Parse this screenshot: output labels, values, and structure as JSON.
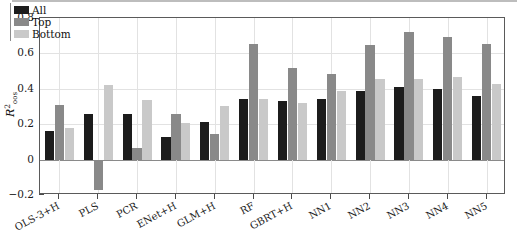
{
  "chart_data": {
    "type": "bar",
    "title": "",
    "subtitle": "",
    "xlabel": "",
    "ylabel": "R2oos",
    "ylabel_parts": {
      "base": "R",
      "superscript": "2",
      "subscript": "oos"
    },
    "ylim": [
      -0.2,
      0.8
    ],
    "yticks": [
      -0.2,
      0,
      0.2,
      0.4,
      0.6,
      0.8
    ],
    "ytick_labels": [
      "−0.2",
      "0",
      "0.2",
      "0.4",
      "0.6",
      "0.8"
    ],
    "grid": true,
    "grid_axis": "both",
    "legend_position": "top-left",
    "categories": [
      "OLS-3+H",
      "PLS",
      "PCR",
      "ENet+H",
      "GLM+H",
      "RF",
      "GBRT+H",
      "NN1",
      "NN2",
      "NN3",
      "NN4",
      "NN5"
    ],
    "series": [
      {
        "name": "All",
        "color": "#1c1c1c",
        "values": [
          0.16,
          0.26,
          0.26,
          0.125,
          0.21,
          0.345,
          0.33,
          0.345,
          0.385,
          0.41,
          0.4,
          0.36
        ]
      },
      {
        "name": "Top",
        "color": "#898989",
        "values": [
          0.31,
          -0.17,
          0.065,
          0.255,
          0.145,
          0.655,
          0.515,
          0.485,
          0.645,
          0.72,
          0.695,
          0.655
        ]
      },
      {
        "name": "Bottom",
        "color": "#c9c9c9",
        "values": [
          0.18,
          0.42,
          0.335,
          0.205,
          0.305,
          0.345,
          0.32,
          0.39,
          0.455,
          0.455,
          0.465,
          0.425
        ]
      }
    ]
  },
  "legend": {
    "items": [
      {
        "label": "All",
        "color": "#1c1c1c"
      },
      {
        "label": "Top",
        "color": "#898989"
      },
      {
        "label": "Bottom",
        "color": "#c9c9c9"
      }
    ]
  },
  "axes": {
    "y": {
      "label_base": "R",
      "label_sup": "2",
      "label_sub": "oos",
      "tick_labels": [
        "0.8",
        "0.6",
        "0.4",
        "0.2",
        "0",
        "−0.2"
      ]
    },
    "x": {
      "tick_labels": [
        "OLS-3+H",
        "PLS",
        "PCR",
        "ENet+H",
        "GLM+H",
        "RF",
        "GBRT+H",
        "NN1",
        "NN2",
        "NN3",
        "NN4",
        "NN5"
      ]
    }
  }
}
